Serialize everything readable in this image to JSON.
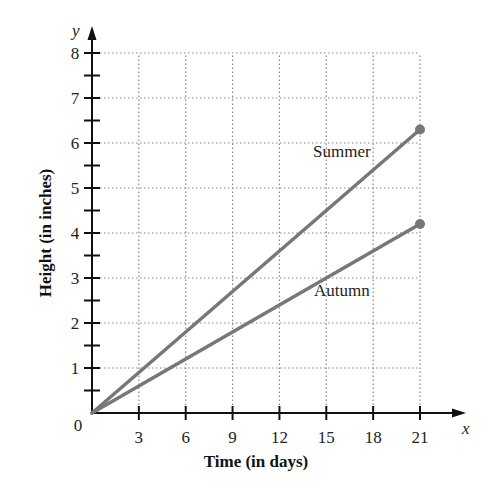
{
  "chart_data": {
    "type": "line",
    "title": "",
    "xlabel": "Time (in days)",
    "ylabel": "Height (in inches)",
    "x_axis_var": "x",
    "y_axis_var": "y",
    "origin_label": "0",
    "xlim": [
      0,
      21
    ],
    "ylim": [
      0,
      8
    ],
    "x_ticks": [
      3,
      6,
      9,
      12,
      15,
      18,
      21
    ],
    "y_ticks": [
      1,
      2,
      3,
      4,
      5,
      6,
      7,
      8
    ],
    "y_minor_step": 0.5,
    "grid": true,
    "grid_style": "dotted",
    "legend": "none (inline series labels)",
    "series": [
      {
        "name": "Summer",
        "x": [
          0,
          21
        ],
        "y": [
          0,
          6.3
        ],
        "label_pos": [
          16,
          5.7
        ],
        "color": "#777777"
      },
      {
        "name": "Autumn",
        "x": [
          0,
          21
        ],
        "y": [
          0,
          4.2
        ],
        "label_pos": [
          16,
          2.6
        ],
        "color": "#777777"
      }
    ]
  },
  "colors": {
    "axis": "#111111",
    "grid": "#888888",
    "line": "#777777",
    "marker": "#777777"
  }
}
